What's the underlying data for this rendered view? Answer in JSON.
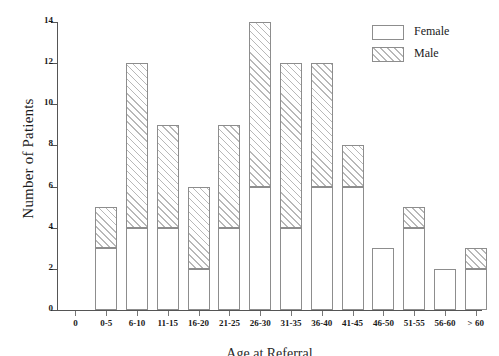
{
  "chart_data": {
    "type": "bar",
    "subtype": "stacked-bar",
    "title": "",
    "xlabel": "Age at Referral",
    "ylabel": "Number of Patients",
    "categories": [
      "0-5",
      "6-10",
      "11-15",
      "16-20",
      "21-25",
      "26-30",
      "31-35",
      "36-40",
      "41-45",
      "46-50",
      "51-55",
      "56-60",
      "> 60"
    ],
    "series": [
      {
        "name": "Female",
        "pattern": "solid-white",
        "values": [
          3,
          4,
          4,
          2,
          4,
          6,
          4,
          6,
          6,
          3,
          4,
          2,
          2
        ]
      },
      {
        "name": "Male",
        "pattern": "diagonal-hatch",
        "values": [
          2,
          8,
          5,
          4,
          5,
          8,
          8,
          6,
          2,
          0,
          1,
          0,
          1
        ]
      }
    ],
    "totals": [
      5,
      12,
      9,
      6,
      9,
      14,
      12,
      12,
      8,
      3,
      5,
      2,
      3
    ],
    "ylim": [
      0,
      14
    ],
    "ytick_values": [
      0,
      2,
      4,
      6,
      8,
      10,
      12,
      14
    ],
    "ytick_labels": [
      "0",
      "2",
      "4",
      "6",
      "8",
      "10",
      "12",
      "14"
    ],
    "xtick_labels": [
      "0",
      "0-5",
      "6-10",
      "11-15",
      "16-20",
      "21-25",
      "26-30",
      "31-35",
      "36-40",
      "41-45",
      "46-50",
      "51-55",
      "56-60",
      "> 60"
    ],
    "grid": false,
    "legend_position": "top-right",
    "legend_entries": [
      "Female",
      "Male"
    ],
    "colors": {
      "bar_fill": "#ffffff",
      "bar_border": "#8d8d8d",
      "hatch": "#b8b8b8",
      "axis": "#555555",
      "text": "#1a1a1a"
    }
  },
  "axes": {
    "y_title": "Number of Patients",
    "x_title": "Age at Referral",
    "origin_label": "0"
  },
  "legend": {
    "items": [
      {
        "label": "Female",
        "swatch": "white-box-icon"
      },
      {
        "label": "Male",
        "swatch": "hatched-box-icon"
      }
    ]
  }
}
